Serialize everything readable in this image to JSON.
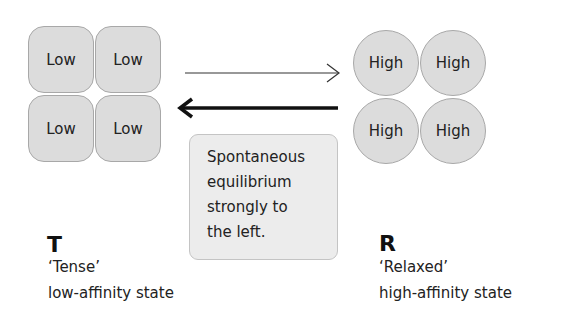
{
  "t_state": {
    "subunits": [
      "Low",
      "Low",
      "Low",
      "Low"
    ],
    "letter": "T",
    "name": "‘Tense’",
    "description": "low-affinity state"
  },
  "r_state": {
    "subunits": [
      "High",
      "High",
      "High",
      "High"
    ],
    "letter": "R",
    "name": "‘Relaxed’",
    "description": "high-affinity state"
  },
  "arrows": {
    "forward": {
      "direction": "T-to-R",
      "weight": "thin"
    },
    "reverse": {
      "direction": "R-to-T",
      "weight": "bold"
    }
  },
  "note": {
    "lines": [
      "Spontaneous",
      "equilibrium",
      "strongly to",
      "the left."
    ]
  },
  "colors": {
    "subunit_fill": "#dcdcdc",
    "subunit_border": "#a8a8a8",
    "note_fill": "#ececec",
    "text": "#222222"
  }
}
